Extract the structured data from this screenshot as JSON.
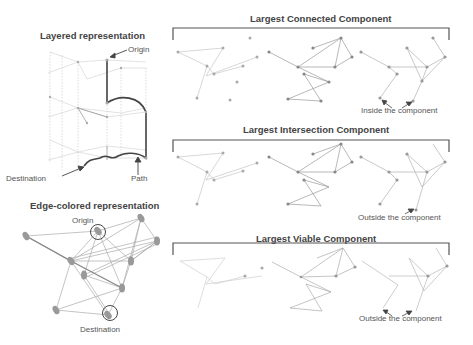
{
  "left": {
    "layered": {
      "title": "Layered representation",
      "origin_label": "Origin",
      "destination_label": "Destination",
      "path_label": "Path"
    },
    "edge_colored": {
      "title": "Edge-colored representation",
      "origin_label": "Origin",
      "destination_label": "Destination"
    }
  },
  "right": {
    "panels": [
      {
        "title": "Largest Connected Component",
        "annotation": "Inside the component"
      },
      {
        "title": "Largest Intersection Component",
        "annotation": "Outside the component"
      },
      {
        "title": "Largest Viable Component",
        "annotation": "Outside the component"
      }
    ]
  },
  "colors": {
    "text": "#444444",
    "edge": "#bbbbbb",
    "edge_dark": "#888888",
    "node": "#999999",
    "bracket": "#555555",
    "path": "#444444"
  }
}
